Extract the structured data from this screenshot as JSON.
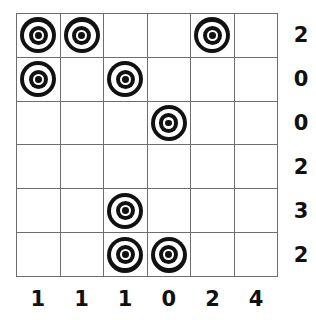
{
  "puzzle": {
    "type": "grid-puzzle",
    "grid_size": {
      "rows": 6,
      "cols": 6
    },
    "token_icon_name": "bullseye-token-icon",
    "colors": {
      "grid_line": "#6d6d6d",
      "token": "#111111",
      "background": "#ffffff",
      "label_text": "#111111"
    },
    "cells": [
      [
        1,
        1,
        0,
        0,
        1,
        0
      ],
      [
        1,
        0,
        1,
        0,
        0,
        0
      ],
      [
        0,
        0,
        0,
        1,
        0,
        0
      ],
      [
        0,
        0,
        0,
        0,
        0,
        0
      ],
      [
        0,
        0,
        1,
        0,
        0,
        0
      ],
      [
        0,
        0,
        1,
        1,
        0,
        0
      ]
    ],
    "row_labels": [
      "2",
      "0",
      "0",
      "2",
      "3",
      "2"
    ],
    "col_labels": [
      "1",
      "1",
      "1",
      "0",
      "2",
      "4"
    ]
  },
  "chart_data": {
    "type": "heatmap",
    "title": "",
    "xlabel": "",
    "ylabel": "",
    "categories": [
      "c1",
      "c2",
      "c3",
      "c4",
      "c5",
      "c6"
    ],
    "rows": [
      "r1",
      "r2",
      "r3",
      "r4",
      "r5",
      "r6"
    ],
    "values": [
      [
        1,
        1,
        0,
        0,
        1,
        0
      ],
      [
        1,
        0,
        1,
        0,
        0,
        0
      ],
      [
        0,
        0,
        0,
        1,
        0,
        0
      ],
      [
        0,
        0,
        0,
        0,
        0,
        0
      ],
      [
        0,
        0,
        1,
        0,
        0,
        0
      ],
      [
        0,
        0,
        1,
        1,
        0,
        0
      ]
    ],
    "row_clues": [
      2,
      0,
      0,
      2,
      3,
      2
    ],
    "col_clues": [
      1,
      1,
      1,
      0,
      2,
      4
    ],
    "grid": true,
    "legend": "none"
  }
}
